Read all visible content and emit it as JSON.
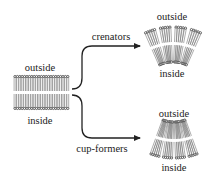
{
  "diagram": {
    "type": "membrane-curvature-schematic",
    "colors": {
      "ink": "#222222",
      "tail": "#777777",
      "head": "#333333",
      "background": "#ffffff"
    },
    "flat_membrane": {
      "top_label": "outside",
      "bottom_label": "inside"
    },
    "branches": [
      {
        "label": "crenators",
        "result": {
          "top_label": "outside",
          "bottom_label": "inside",
          "curvature": "convex-outward"
        }
      },
      {
        "label": "cup-formers",
        "result": {
          "top_label": "outside",
          "bottom_label": "inside",
          "curvature": "concave-outward"
        }
      }
    ]
  }
}
